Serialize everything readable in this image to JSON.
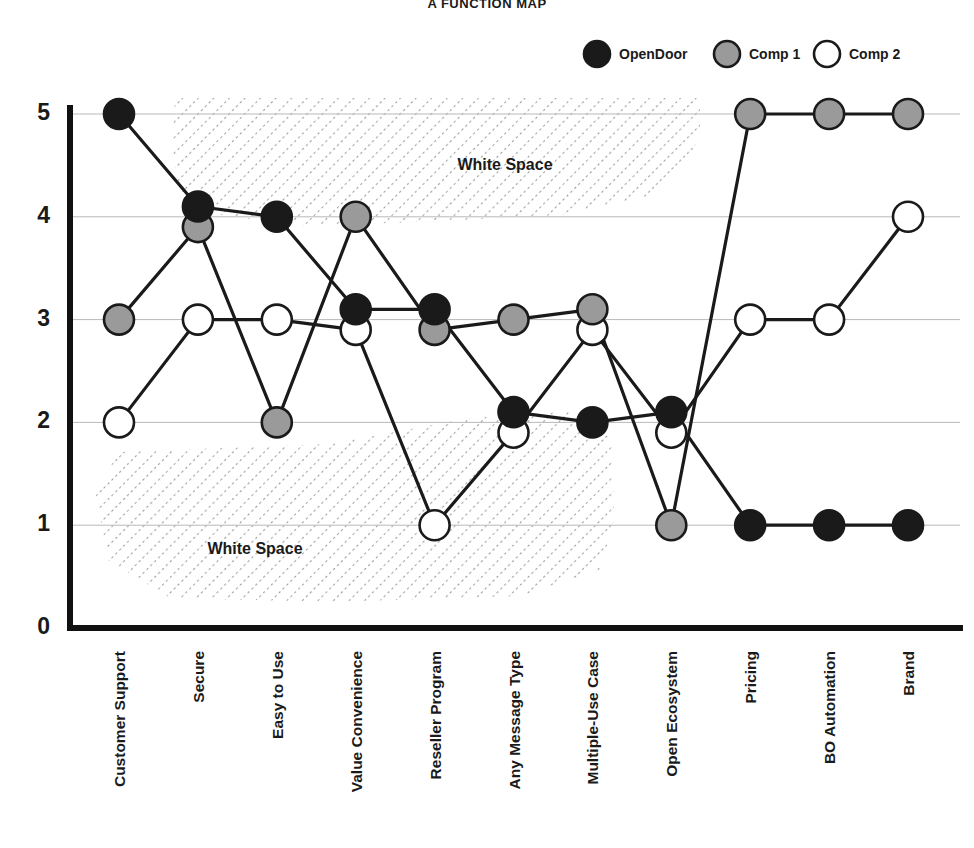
{
  "chart_data": {
    "type": "line",
    "title": "A FUNCTION MAP",
    "xlabel": "",
    "ylabel": "",
    "ylim": [
      0,
      5
    ],
    "yticks": [
      "0",
      "1",
      "2",
      "3",
      "4",
      "5"
    ],
    "grid": true,
    "legend_position": "top-right",
    "categories": [
      "Customer Support",
      "Secure",
      "Easy to Use",
      "Value Convenience",
      "Reseller Program",
      "Any Message Type",
      "Multiple-Use Case",
      "Open Ecosystem",
      "Pricing",
      "BO Automation",
      "Brand"
    ],
    "series": [
      {
        "name": "OpenDoor",
        "color": "#1a1a1a",
        "values": [
          5,
          4.1,
          4,
          3.1,
          3.1,
          2.1,
          2,
          2.1,
          1,
          1,
          1
        ]
      },
      {
        "name": "Comp 1",
        "color": "#9a9a9a",
        "values": [
          3,
          3.9,
          2,
          4,
          2.9,
          3,
          3.1,
          1,
          5,
          5,
          5
        ]
      },
      {
        "name": "Comp 2",
        "color": "#ffffff",
        "values": [
          2,
          3,
          3,
          2.9,
          1,
          1.9,
          2.9,
          1.9,
          3,
          3,
          4
        ]
      }
    ],
    "annotations": [
      {
        "text": "White Space",
        "region": "upper"
      },
      {
        "text": "White Space",
        "region": "lower"
      }
    ]
  },
  "legend": {
    "items": [
      {
        "label": "OpenDoor",
        "swatch": "black-circle"
      },
      {
        "label": "Comp 1",
        "swatch": "gray-circle"
      },
      {
        "label": "Comp 2",
        "swatch": "white-circle"
      }
    ]
  },
  "colors": {
    "opendoor": "#1a1a1a",
    "comp1": "#9a9a9a",
    "comp2": "#ffffff",
    "stroke": "#1a1a1a",
    "grid": "#b9b9b9",
    "axis": "#111111",
    "hatch": "#9c9c9c"
  }
}
